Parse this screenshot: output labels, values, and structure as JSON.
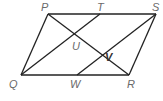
{
  "diagram": {
    "type": "parallelogram-geometry",
    "points": {
      "P": {
        "label": "P",
        "x": 48,
        "y": 14
      },
      "T": {
        "label": "T",
        "x": 100,
        "y": 14
      },
      "S": {
        "label": "S",
        "x": 156,
        "y": 14
      },
      "Q": {
        "label": "Q",
        "x": 21,
        "y": 75
      },
      "W": {
        "label": "W",
        "x": 77,
        "y": 75
      },
      "R": {
        "label": "R",
        "x": 129,
        "y": 75
      },
      "U": {
        "label": "U",
        "x": 76,
        "y": 35
      },
      "V": {
        "label": "V",
        "x": 104,
        "y": 56
      }
    },
    "segments": [
      [
        "P",
        "S"
      ],
      [
        "S",
        "R"
      ],
      [
        "R",
        "Q"
      ],
      [
        "Q",
        "P"
      ],
      [
        "P",
        "R"
      ],
      [
        "Q",
        "T"
      ],
      [
        "W",
        "S"
      ]
    ]
  }
}
